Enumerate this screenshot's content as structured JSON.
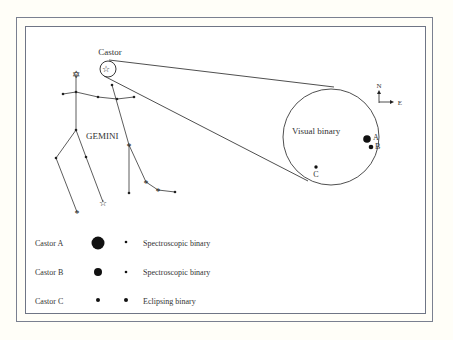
{
  "labels": {
    "castor": "Castor",
    "constellation": "GEMINI",
    "visual_binary": "Visual binary",
    "star_a": "A",
    "star_b": "B",
    "star_c": "C",
    "compass_north": "N",
    "compass_east": "E"
  },
  "legend": [
    {
      "name": "Castor A",
      "type": "Spectroscopic binary"
    },
    {
      "name": "Castor B",
      "type": "Spectroscopic binary"
    },
    {
      "name": "Castor C",
      "type": "Eclipsing binary"
    }
  ],
  "colors": {
    "ink": "#222222",
    "frame": "#737988",
    "background": "#fffef8"
  }
}
